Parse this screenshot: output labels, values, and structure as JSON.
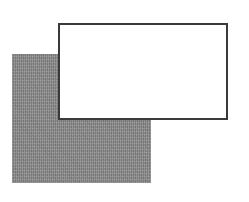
{
  "diagram": {
    "shapes": [
      {
        "id": "back-rect",
        "type": "rectangle",
        "fill": "#8c8c8c",
        "fill_style": "textured-gray",
        "stroke": "none",
        "x": 12,
        "y": 54,
        "width": 139,
        "height": 129,
        "layer": "back"
      },
      {
        "id": "front-rect",
        "type": "rectangle",
        "fill": "#ffffff",
        "stroke": "#3a3a3a",
        "stroke_width": 2,
        "x": 58,
        "y": 23,
        "width": 170,
        "height": 97,
        "layer": "front"
      }
    ]
  }
}
